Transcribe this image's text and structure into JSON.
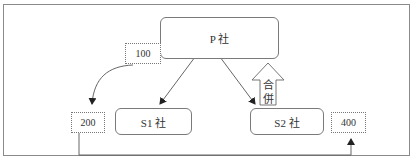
{
  "diagram": {
    "nodes": {
      "parent": {
        "label": "P 社"
      },
      "s1": {
        "label": "S1 社"
      },
      "s2": {
        "label": "S2 社"
      }
    },
    "amounts": {
      "p_value": "100",
      "s1_value": "200",
      "s2_value": "400"
    },
    "merge_arrow": {
      "label": "合併"
    },
    "edges": [
      {
        "from": "parent",
        "to": "s1",
        "type": "arrow"
      },
      {
        "from": "parent",
        "to": "s2",
        "type": "arrow"
      },
      {
        "from": "amount-100",
        "to": "amount-200",
        "type": "curved-arrow"
      },
      {
        "from": "amount-200",
        "to": "amount-400",
        "type": "elbow-arrow"
      },
      {
        "from": "s2",
        "to": "parent",
        "type": "block-arrow",
        "label": "合併"
      }
    ]
  }
}
